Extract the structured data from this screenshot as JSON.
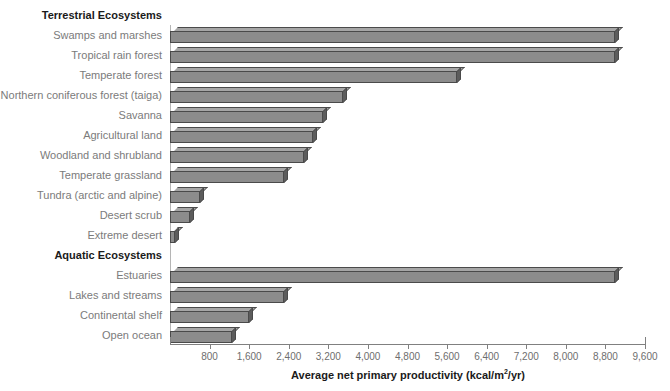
{
  "chart_data": {
    "type": "bar",
    "orientation": "horizontal",
    "title": "",
    "xlabel": "Average net primary productivity (kcal/m2/yr)",
    "xlabel_display": "Average net primary productivity (kcal/m",
    "xlabel_sup": "2",
    "xlabel_tail": "/yr)",
    "ylabel": "",
    "xlim": [
      0,
      9600
    ],
    "xtick_step": 800,
    "grid": false,
    "legend": false,
    "xticks": [
      "800",
      "1,600",
      "2,400",
      "3,200",
      "4,000",
      "4,800",
      "5,600",
      "6,400",
      "7,200",
      "8,000",
      "8,800",
      "9,600"
    ],
    "xtick_values": [
      800,
      1600,
      2400,
      3200,
      4000,
      4800,
      5600,
      6400,
      7200,
      8000,
      8800,
      9600
    ],
    "groups": [
      {
        "label": "Terrestrial Ecosystems",
        "categories": [
          "Swamps and marshes",
          "Tropical rain forest",
          "Temperate forest",
          "Northern coniferous forest (taiga)",
          "Savanna",
          "Agricultural land",
          "Woodland and shrubland",
          "Temperate grassland",
          "Tundra (arctic and alpine)",
          "Desert scrub",
          "Extreme desert"
        ],
        "values": [
          9000,
          9000,
          5800,
          3500,
          3100,
          2900,
          2700,
          2300,
          600,
          400,
          100
        ]
      },
      {
        "label": "Aquatic Ecosystems",
        "categories": [
          "Estuaries",
          "Lakes and streams",
          "Continental shelf",
          "Open ocean"
        ],
        "values": [
          9000,
          2300,
          1600,
          1250
        ]
      }
    ],
    "colors": {
      "bar_face": "#8c8c8c",
      "bar_top": "#a6a6a6",
      "bar_side": "#5c5c5c",
      "bar_outline": "#4a4a4a",
      "label_text": "#7b7b7b",
      "group_header_text": "#1a1a1a",
      "axis": "#808080",
      "background": "#ffffff"
    }
  }
}
